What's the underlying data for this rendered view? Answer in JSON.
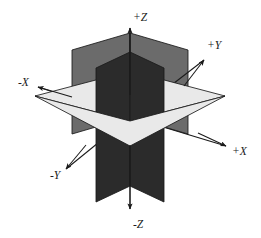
{
  "figure": {
    "background_color": "#ffffff",
    "width": 261,
    "height": 238
  },
  "colors": {
    "plane_dark": "#2b2b2b",
    "plane_medium": "#6b6b6b",
    "plane_light": "#e9e9e9",
    "outline": "#1a1a1a",
    "label_text": "#1a1a1a"
  },
  "origin": {
    "x": 130,
    "y": 117
  },
  "axes": [
    {
      "id": "plus-z",
      "label": "+Z",
      "label_x": 133,
      "label_y": 18,
      "start_x": 130,
      "start_y": 95,
      "end_x": 130,
      "end_y": 28,
      "arrow_angle_deg": -90,
      "direction": "up"
    },
    {
      "id": "minus-z",
      "label": "-Z",
      "label_x": 133,
      "label_y": 225,
      "start_x": 130,
      "start_y": 145,
      "end_x": 130,
      "end_y": 209,
      "arrow_angle_deg": 90,
      "direction": "down"
    },
    {
      "id": "plus-y",
      "label": "+Y",
      "label_x": 207,
      "label_y": 46,
      "start_x": 184,
      "start_y": 86,
      "end_x": 204,
      "end_y": 60,
      "arrow_angle_deg": -52,
      "direction": "up-right"
    },
    {
      "id": "minus-y",
      "label": "-Y",
      "label_x": 50,
      "label_y": 176,
      "start_x": 86,
      "start_y": 145,
      "end_x": 66,
      "end_y": 169,
      "arrow_angle_deg": 130,
      "direction": "down-left"
    },
    {
      "id": "plus-x",
      "label": "+X",
      "label_x": 232,
      "label_y": 152,
      "start_x": 198,
      "start_y": 133,
      "end_x": 226,
      "end_y": 146,
      "arrow_angle_deg": 25,
      "direction": "right-down"
    },
    {
      "id": "minus-x",
      "label": "-X",
      "label_x": 18,
      "label_y": 83,
      "start_x": 72,
      "start_y": 97,
      "end_x": 38,
      "end_y": 87,
      "arrow_angle_deg": 196,
      "direction": "left-up"
    }
  ],
  "planes": [
    {
      "id": "plane-yz-back-left",
      "name": "YZ plane (back-left quadrant)",
      "shade": "medium",
      "points": "72,50 130,33 130,117 72,134"
    },
    {
      "id": "plane-yz-back-right",
      "name": "YZ plane (upper-right wing)",
      "shade": "medium",
      "points": "130,33 188,50 188,134 130,117"
    },
    {
      "id": "plane-xy-horizontal-back",
      "name": "XY horizontal plane (far half)",
      "shade": "light",
      "points": "35,96 130,71 225,96 130,121"
    },
    {
      "id": "plane-xz-front",
      "name": "XZ plane (front, dark)",
      "shade": "dark",
      "points": "96,68 130,52 130,186 96,202"
    },
    {
      "id": "plane-xz-front-right",
      "name": "XZ plane (front-right, dark)",
      "shade": "dark",
      "points": "130,52 164,68 164,202 130,186"
    },
    {
      "id": "plane-xy-horizontal-front",
      "name": "XY horizontal plane (near half)",
      "shade": "light",
      "points": "35,96 130,121 225,96 130,146"
    }
  ]
}
